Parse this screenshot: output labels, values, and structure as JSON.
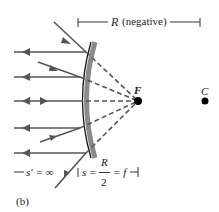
{
  "figure": {
    "panel_label": "(b)",
    "radius_label": "R",
    "radius_note": "(negative)",
    "focal_label": "F",
    "center_label": "C",
    "eq_sprime": "s′ = ∞",
    "eq_s": "s =",
    "eq_num": "R",
    "eq_den": "2",
    "eq_f": "= f"
  },
  "colors": {
    "ray": "#555555",
    "mirror_back": "#8a8a8a",
    "mirror_front": "#111111",
    "point": "#000000"
  }
}
